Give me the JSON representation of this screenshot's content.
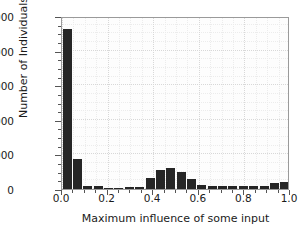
{
  "chart_data": {
    "type": "bar",
    "title": "",
    "subtitle": "",
    "xlabel": "Maximum influence of some input",
    "ylabel": "Number of Individuals",
    "xlim": [
      0.0,
      1.0
    ],
    "ylim": [
      0,
      10000
    ],
    "grid": true,
    "legend": null,
    "legend_position": "none",
    "bar_color": "#262626",
    "bin_width": 0.0455,
    "xticks": [
      "0.0",
      "0.2",
      "0.4",
      "0.6",
      "0.8",
      "1.0"
    ],
    "xtick_values": [
      0.0,
      0.2,
      0.4,
      0.6,
      0.8,
      1.0
    ],
    "yticks": [
      "0",
      "2000",
      "4000",
      "6000",
      "8000",
      "10000"
    ],
    "ytick_values": [
      0,
      2000,
      4000,
      6000,
      8000,
      10000
    ],
    "categories": [
      "0.000",
      "0.045",
      "0.091",
      "0.136",
      "0.182",
      "0.227",
      "0.273",
      "0.318",
      "0.364",
      "0.409",
      "0.455",
      "0.500",
      "0.545",
      "0.591",
      "0.636",
      "0.682",
      "0.727",
      "0.773",
      "0.818",
      "0.864",
      "0.909",
      "0.955"
    ],
    "x": [
      0.0,
      0.045,
      0.091,
      0.136,
      0.182,
      0.227,
      0.273,
      0.318,
      0.364,
      0.409,
      0.455,
      0.5,
      0.545,
      0.591,
      0.636,
      0.682,
      0.727,
      0.773,
      0.818,
      0.864,
      0.909,
      0.955
    ],
    "values": [
      9250,
      1750,
      160,
      150,
      40,
      30,
      90,
      140,
      610,
      1080,
      1210,
      960,
      560,
      230,
      190,
      190,
      200,
      190,
      180,
      190,
      330,
      430
    ]
  },
  "figure": {
    "background_color": "#ffffff",
    "axis_color": "#9a9a9a",
    "text_color": "#1a1a1a"
  }
}
